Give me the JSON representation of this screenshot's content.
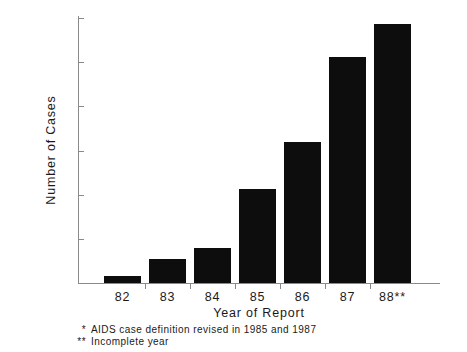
{
  "chart_data": {
    "type": "bar",
    "title": "",
    "xlabel": "Year of Report",
    "ylabel": "Number of Cases",
    "categories": [
      "82",
      "83",
      "84",
      "85",
      "86",
      "87",
      "88**"
    ],
    "values": [
      8,
      27,
      40,
      106,
      160,
      256,
      293
    ],
    "ylim": [
      0,
      300
    ],
    "yticks": [
      0,
      50,
      100,
      150,
      200,
      250,
      300
    ],
    "ytick_labels": [
      "0",
      "50",
      "100",
      "150",
      "200",
      "250",
      "300"
    ],
    "grid": false,
    "legend": "none",
    "bar_color": "#0d0d0d",
    "axis_color": "#8a8a8a",
    "background_color": "#ffffff",
    "annotations": [
      "* AIDS case definition revised in 1985 and 1987",
      "** Incomplete year"
    ]
  },
  "axes": {
    "y_title": "Number of Cases",
    "x_title": "Year of Report"
  },
  "footnotes": [
    {
      "marker": "*",
      "text": "AIDS case definition revised in 1985 and 1987"
    },
    {
      "marker": "**",
      "text": "Incomplete year"
    }
  ]
}
